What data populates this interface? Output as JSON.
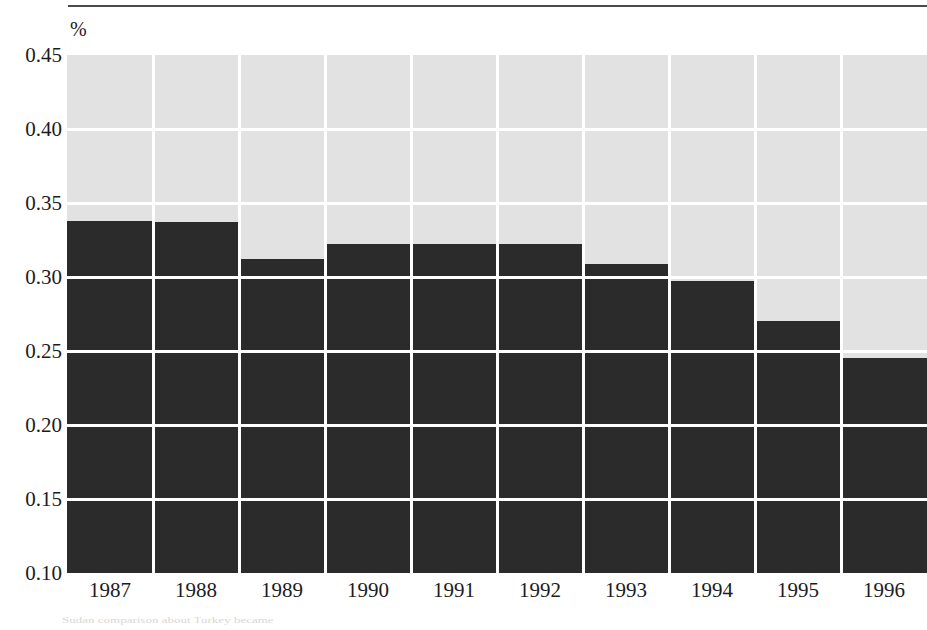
{
  "chart_data": {
    "type": "bar",
    "title": "",
    "subtitle": "",
    "xlabel": "",
    "ylabel": "%",
    "unit_label": "%",
    "categories": [
      "1987",
      "1988",
      "1989",
      "1990",
      "1991",
      "1992",
      "1993",
      "1994",
      "1995",
      "1996"
    ],
    "values": [
      0.338,
      0.337,
      0.312,
      0.322,
      0.322,
      0.322,
      0.309,
      0.297,
      0.27,
      0.245
    ],
    "series": [
      {
        "name": "",
        "values": [
          0.338,
          0.337,
          0.312,
          0.322,
          0.322,
          0.322,
          0.309,
          0.297,
          0.27,
          0.245
        ]
      }
    ],
    "ylim": [
      0.1,
      0.45
    ],
    "yticks": [
      0.1,
      0.15,
      0.2,
      0.25,
      0.3,
      0.35,
      0.4,
      0.45
    ],
    "ytick_labels": [
      "0.10",
      "0.15",
      "0.20",
      "0.25",
      "0.30",
      "0.35",
      "0.40",
      "0.45"
    ],
    "grid": true,
    "grid_orientation": "both",
    "legend": null,
    "legend_position": "none",
    "bar_color": "#2b2b2b",
    "plot_background_color": "#e2e2e2",
    "gridline_color": "#ffffff",
    "axis_text_color": "#1c1c1c"
  },
  "axes": {
    "y": {
      "unit": "%",
      "ticks": [
        {
          "label": "0.45",
          "value": 0.45
        },
        {
          "label": "0.40",
          "value": 0.4
        },
        {
          "label": "0.35",
          "value": 0.35
        },
        {
          "label": "0.30",
          "value": 0.3
        },
        {
          "label": "0.25",
          "value": 0.25
        },
        {
          "label": "0.20",
          "value": 0.2
        },
        {
          "label": "0.15",
          "value": 0.15
        },
        {
          "label": "0.10",
          "value": 0.1
        }
      ]
    },
    "x": {
      "ticks": [
        {
          "label": "1987"
        },
        {
          "label": "1988"
        },
        {
          "label": "1989"
        },
        {
          "label": "1990"
        },
        {
          "label": "1991"
        },
        {
          "label": "1992"
        },
        {
          "label": "1993"
        },
        {
          "label": "1994"
        },
        {
          "label": "1995"
        },
        {
          "label": "1996"
        }
      ]
    }
  },
  "page": {
    "top_rule": true,
    "bleed_through_text": "Sudan comparison about Turkey became"
  }
}
